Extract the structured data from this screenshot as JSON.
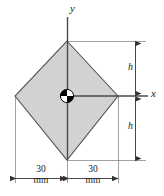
{
  "figure": {
    "type": "engineering-cross-section-diagram",
    "shape_name": "rhombus",
    "axes": {
      "y_label": "y",
      "x_label": "x"
    },
    "dimensions": {
      "vertical_upper": {
        "label": "h"
      },
      "vertical_lower": {
        "label": "h"
      },
      "horizontal_left": {
        "value": "30",
        "unit": "mm"
      },
      "horizontal_right": {
        "value": "30",
        "unit": "mm"
      }
    },
    "colors": {
      "fill": "#d2d2d2",
      "outline": "#555555",
      "line": "#4a4a4a",
      "text": "#1a1a1a",
      "marker": "#000000"
    },
    "geometry": {
      "top_vertex": [
        67,
        41
      ],
      "right_vertex": [
        118,
        96
      ],
      "bottom_vertex": [
        67,
        160
      ],
      "left_vertex": [
        15,
        96
      ],
      "centroid": [
        67,
        96
      ]
    }
  }
}
